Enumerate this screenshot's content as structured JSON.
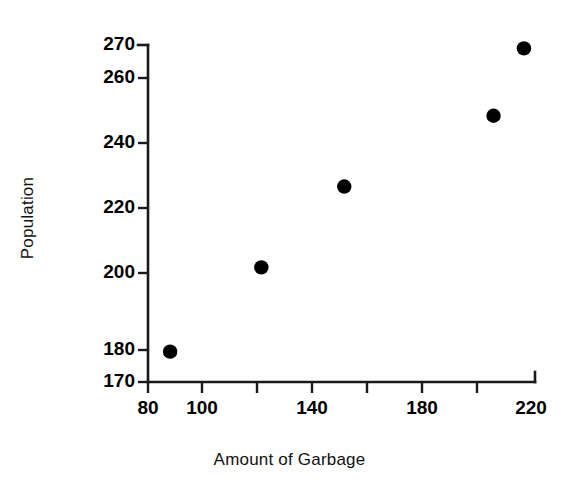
{
  "chart_data": {
    "type": "scatter",
    "title": "",
    "xlabel": "Amount of Garbage",
    "ylabel": "Population",
    "x": [
      88,
      121,
      151,
      205,
      216
    ],
    "y": [
      179,
      204,
      228,
      249,
      269
    ],
    "points": [
      {
        "x": 88,
        "y": 179
      },
      {
        "x": 121,
        "y": 204
      },
      {
        "x": 151,
        "y": 228
      },
      {
        "x": 205,
        "y": 249
      },
      {
        "x": 216,
        "y": 269
      }
    ],
    "xlim": [
      80,
      220
    ],
    "ylim": [
      170,
      270
    ],
    "xticks": [
      80,
      100,
      120,
      140,
      160,
      180,
      200,
      220
    ],
    "xtick_labels": [
      "80",
      "100",
      "",
      "140",
      "",
      "180",
      "",
      "220"
    ],
    "yticks": [
      170,
      180,
      200,
      220,
      240,
      260,
      270
    ],
    "ytick_labels": [
      "170",
      "180",
      "200",
      "220",
      "240",
      "260",
      "270"
    ],
    "grid": false,
    "legend": false,
    "marker": "filled-circle",
    "marker_color": "#000000",
    "axis_color": "#1a1a1a",
    "background": "#ffffff"
  }
}
